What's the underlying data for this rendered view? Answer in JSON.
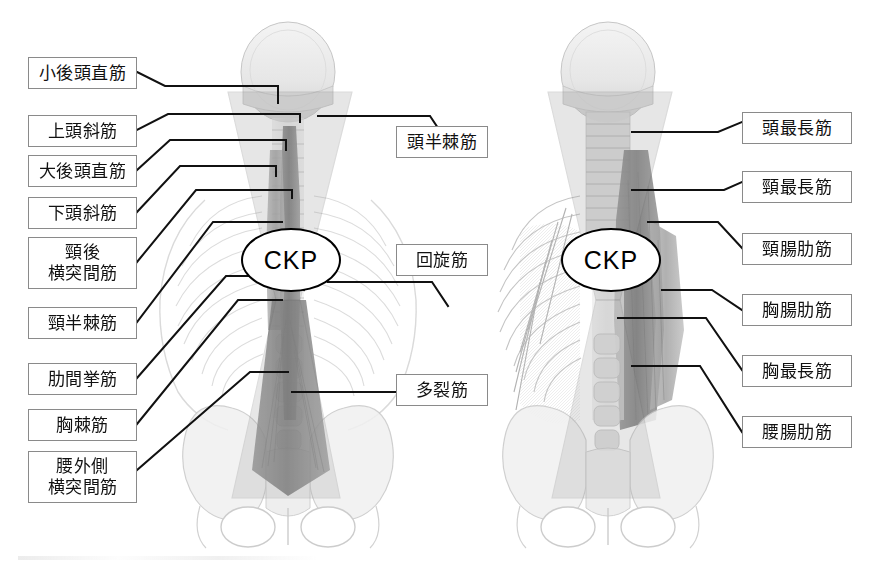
{
  "figure": {
    "type": "anatomical-diagram",
    "title": "",
    "background_color": "#ffffff",
    "line_color": "#111111",
    "box_border_color": "#8a8a8a",
    "panels": [
      {
        "id": "left-panel",
        "name": "posterior-deep-muscles",
        "marker": "CKP"
      },
      {
        "id": "right-panel",
        "name": "erector-spinae-muscles",
        "marker": "CKP"
      }
    ]
  },
  "markers": {
    "left_ckp": "CKP",
    "right_ckp": "CKP"
  },
  "left_labels": [
    {
      "id": "rectus-capitis-posterior-minor",
      "text": "小後頭直筋",
      "lines": 1
    },
    {
      "id": "obliquus-capitis-superior",
      "text": "上頭斜筋",
      "lines": 1
    },
    {
      "id": "rectus-capitis-posterior-major",
      "text": "大後頭直筋",
      "lines": 1
    },
    {
      "id": "obliquus-capitis-inferior",
      "text": "下頭斜筋",
      "lines": 1
    },
    {
      "id": "intertransversarii-cervicis-posterior",
      "text": "頸後\n横突間筋",
      "lines": 2
    },
    {
      "id": "semispinalis-cervicis",
      "text": "頸半棘筋",
      "lines": 1
    },
    {
      "id": "levatores-costarum",
      "text": "肋間挙筋",
      "lines": 1
    },
    {
      "id": "spinalis-thoracis",
      "text": "胸棘筋",
      "lines": 1
    },
    {
      "id": "intertransversarii-lumborum-lateral",
      "text": "腰外側\n横突間筋",
      "lines": 2
    }
  ],
  "center_labels": [
    {
      "id": "semispinalis-capitis",
      "text": "頭半棘筋",
      "lines": 1
    },
    {
      "id": "rotatores",
      "text": "回旋筋",
      "lines": 1
    },
    {
      "id": "multifidus",
      "text": "多裂筋",
      "lines": 1
    }
  ],
  "right_labels": [
    {
      "id": "longissimus-capitis",
      "text": "頭最長筋",
      "lines": 1
    },
    {
      "id": "longissimus-cervicis",
      "text": "頸最長筋",
      "lines": 1
    },
    {
      "id": "iliocostalis-cervicis",
      "text": "頸腸肋筋",
      "lines": 1
    },
    {
      "id": "iliocostalis-thoracis",
      "text": "胸腸肋筋",
      "lines": 1
    },
    {
      "id": "longissimus-thoracis",
      "text": "胸最長筋",
      "lines": 1
    },
    {
      "id": "iliocostalis-lumborum",
      "text": "腰腸肋筋",
      "lines": 1
    }
  ]
}
